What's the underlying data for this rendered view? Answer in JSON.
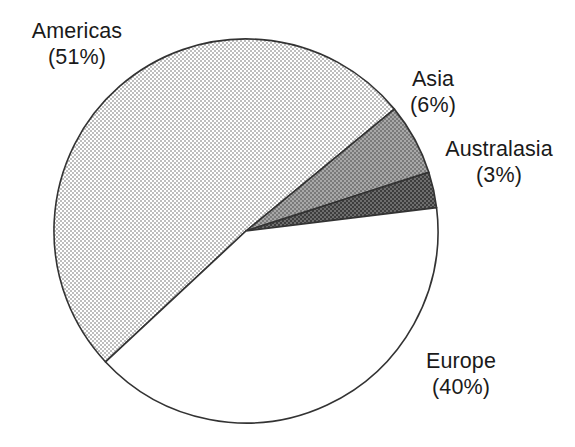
{
  "figure": {
    "background_color": "#ffffff",
    "stroke_color": "#333333"
  },
  "chart_data": {
    "type": "pie",
    "title": "",
    "xlabel": "",
    "ylabel": "",
    "legend_position": "none",
    "grid": false,
    "units": "percent",
    "total": 100,
    "label_format": "{name}\n({value}%)",
    "start_angle_deg": 227,
    "direction": "clockwise",
    "center": {
      "x": 246,
      "y": 231
    },
    "radius": 192,
    "categories": [
      "Americas",
      "Asia",
      "Australasia",
      "Europe"
    ],
    "values": [
      51,
      6,
      3,
      40
    ],
    "colors": [
      "#d9d9d9",
      "#8c8c8c",
      "#585858",
      "#ffffff"
    ],
    "slices": [
      {
        "name": "Americas",
        "value": 51,
        "label_name": "Americas",
        "label_pct": "(51%)",
        "fill": "#d9d9d9",
        "pattern": "light-dither"
      },
      {
        "name": "Asia",
        "value": 6,
        "label_name": "Asia",
        "label_pct": "(6%)",
        "fill": "#8c8c8c",
        "pattern": "medium-dither"
      },
      {
        "name": "Australasia",
        "value": 3,
        "label_name": "Australasia",
        "label_pct": "(3%)",
        "fill": "#585858",
        "pattern": "dark-dither"
      },
      {
        "name": "Europe",
        "value": 40,
        "label_name": "Europe",
        "label_pct": "(40%)",
        "fill": "#ffffff",
        "pattern": "none"
      }
    ]
  }
}
